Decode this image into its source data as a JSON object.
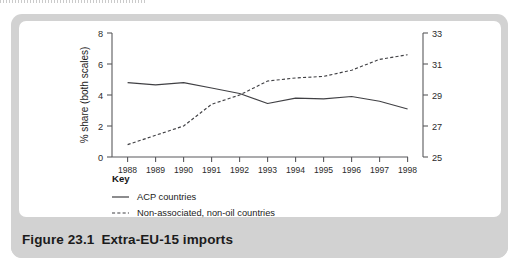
{
  "figure": {
    "caption_number": "Figure 23.1",
    "caption_title": "Extra-EU-15 imports"
  },
  "key": {
    "title": "Key",
    "entries": [
      {
        "label": "ACP countries",
        "style": "solid"
      },
      {
        "label": "Non-associated, non-oil countries",
        "style": "dashed"
      }
    ]
  },
  "colors": {
    "plate": "#d2d2d2",
    "panel": "#ffffff",
    "axis": "#59595c",
    "series": "#404044",
    "text": "#1b1b1b"
  },
  "chart_data": {
    "type": "line",
    "title": "",
    "xlabel": "",
    "ylabel": "% share (both scales)",
    "grid": false,
    "legend_position": "below-left",
    "categories": [
      "1988",
      "1989",
      "1990",
      "1991",
      "1992",
      "1993",
      "1994",
      "1995",
      "1996",
      "1997",
      "1998"
    ],
    "yaxis_left": {
      "label": "% share (both scales)",
      "ticks": [
        0,
        2,
        4,
        6,
        8
      ],
      "ylim": [
        0,
        8
      ]
    },
    "yaxis_right": {
      "label": "",
      "ticks": [
        25,
        27,
        29,
        31,
        33
      ],
      "ylim": [
        25,
        33
      ]
    },
    "series": [
      {
        "name": "ACP countries",
        "style": "solid",
        "axis": "left",
        "values": [
          4.8,
          4.65,
          4.8,
          4.45,
          4.1,
          3.45,
          3.8,
          3.75,
          3.9,
          3.6,
          3.1
        ]
      },
      {
        "name": "Non-associated, non-oil countries",
        "style": "dashed",
        "axis": "right",
        "values": [
          25.8,
          26.4,
          27.0,
          28.4,
          29.0,
          29.9,
          30.1,
          30.2,
          30.6,
          31.3,
          31.6
        ]
      }
    ]
  }
}
